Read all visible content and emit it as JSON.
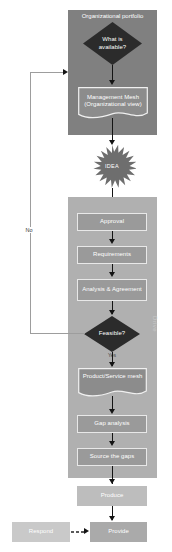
{
  "diagram": {
    "panels": {
      "top": {
        "title": "Organizational portfolio",
        "color": "#808080"
      },
      "main": {
        "title": "Drive",
        "color": "#b0b0b0"
      }
    },
    "nodes": {
      "what_is_available": "What is available?",
      "management_mesh": "Management Mesh (Organizational view)",
      "idea": "IDEA",
      "approval": "Approval",
      "requirements": "Requirements",
      "analysis_agreement": "Analysis & Agreement",
      "feasible": "Feasible?",
      "product_service_mesh": "Product/Service mesh",
      "gap_analysis": "Gap analysis",
      "source_the_gaps": "Source the gaps",
      "produce": "Produce",
      "respond": "Respond",
      "provide": "Provide"
    },
    "edge_labels": {
      "no": "No",
      "yes": "Yes"
    },
    "colors": {
      "panel_top": "#808080",
      "panel_main": "#b0b0b0",
      "box_fill": "#9a9a9a",
      "diamond_fill": "#2b2b2b",
      "star_fill": "#6e6e6e",
      "produce_fill": "#bdbdbd",
      "respond_fill": "#c9c9c9",
      "provide_fill": "#aaaaaa",
      "text": "#ffffff",
      "connector": "#141414"
    }
  }
}
